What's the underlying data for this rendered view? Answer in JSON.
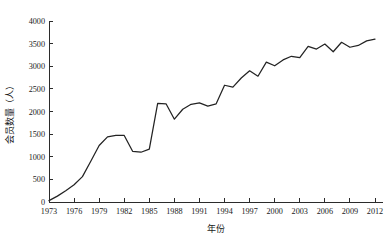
{
  "chart_data": {
    "type": "line",
    "title": "",
    "subtitle": "",
    "xlabel": "年份",
    "ylabel": "会员数量（人）",
    "xlim": [
      1973,
      2012
    ],
    "ylim": [
      0,
      4000
    ],
    "grid": false,
    "legend": null,
    "legend_position": "none",
    "line_color": "#232323",
    "axis_color": "#2b2b2b",
    "background_color": "#ffffff",
    "x_tick_labels": [
      "1973",
      "1976",
      "1979",
      "1982",
      "1985",
      "1988",
      "1991",
      "1994",
      "1997",
      "2000",
      "2003",
      "2006",
      "2009",
      "2012"
    ],
    "x_tick_values": [
      1973,
      1976,
      1979,
      1982,
      1985,
      1988,
      1991,
      1994,
      1997,
      2000,
      2003,
      2006,
      2009,
      2012
    ],
    "y_tick_labels": [
      "0",
      "500",
      "1000",
      "1500",
      "2000",
      "2500",
      "3000",
      "3500",
      "4000"
    ],
    "y_tick_values": [
      0,
      500,
      1000,
      1500,
      2000,
      2500,
      3000,
      3500,
      4000
    ],
    "series": [
      {
        "name": "会员数量",
        "x": [
          1973,
          1974,
          1975,
          1976,
          1977,
          1978,
          1979,
          1980,
          1981,
          1982,
          1983,
          1984,
          1985,
          1986,
          1987,
          1988,
          1989,
          1990,
          1991,
          1992,
          1993,
          1994,
          1995,
          1996,
          1997,
          1998,
          1999,
          2000,
          2001,
          2002,
          2003,
          2004,
          2005,
          2006,
          2007,
          2008,
          2009,
          2010,
          2011,
          2012
        ],
        "values": [
          30,
          130,
          250,
          380,
          560,
          900,
          1250,
          1440,
          1470,
          1470,
          1120,
          1100,
          1170,
          2180,
          2170,
          1830,
          2050,
          2160,
          2190,
          2120,
          2170,
          2580,
          2540,
          2740,
          2900,
          2780,
          3090,
          3010,
          3140,
          3220,
          3190,
          3440,
          3380,
          3490,
          3320,
          3530,
          3420,
          3460,
          3560,
          3600
        ]
      }
    ],
    "annotations": []
  }
}
